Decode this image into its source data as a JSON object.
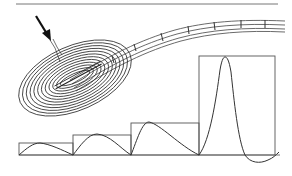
{
  "figure": {
    "colors": {
      "background": "#ffffff",
      "line": "#3a3a3a",
      "arrow": "#111111",
      "rule": "#777777"
    },
    "top_rule": {
      "x1": 16,
      "y1": 4,
      "x2": 278,
      "y2": 4
    },
    "corpuscle": {
      "center": [
        75,
        78
      ],
      "rotation_deg": -24,
      "ring_count": 12,
      "rx_outer": 60,
      "ry_outer": 32
    },
    "arrow": {
      "from": [
        36,
        16
      ],
      "to": [
        51,
        41
      ]
    },
    "stimulus_steps": [
      {
        "x": 19,
        "y_top": 143,
        "width": 54
      },
      {
        "x": 73,
        "y_top": 135,
        "width": 58
      },
      {
        "x": 131,
        "y_top": 123,
        "width": 68
      },
      {
        "x": 199,
        "y_top": 56,
        "width": 76
      }
    ],
    "baseline": {
      "x1": 19,
      "x2": 280,
      "y": 155
    },
    "responses": [
      {
        "label": "response-1",
        "peak": [
          40,
          143
        ]
      },
      {
        "label": "response-2",
        "peak": [
          97,
          134
        ]
      },
      {
        "label": "response-3",
        "peak": [
          149,
          122
        ]
      },
      {
        "label": "response-4",
        "peak": [
          225,
          57
        ],
        "undershoot": [
          257,
          162
        ]
      }
    ]
  }
}
